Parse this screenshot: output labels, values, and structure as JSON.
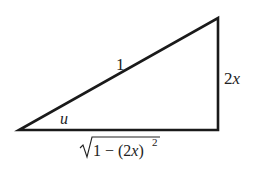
{
  "diagram": {
    "type": "right-triangle",
    "hypotenuse_label": "1",
    "opposite_label": "2x",
    "adjacent_label": "√1 − (2x)²",
    "adjacent_radicand": "1 − (2x)",
    "adjacent_exponent": "2",
    "angle_label": "u",
    "stroke_color": "#1a1a1a"
  }
}
